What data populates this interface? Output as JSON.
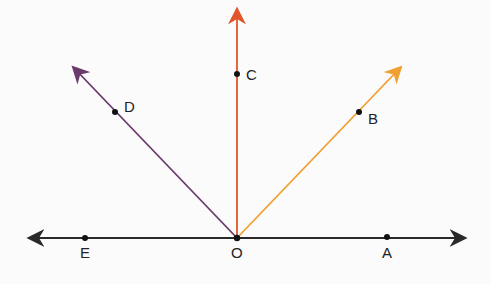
{
  "diagram": {
    "type": "rays from a point on a line",
    "origin": {
      "label": "O"
    },
    "points": [
      {
        "label": "A",
        "on": "line, right"
      },
      {
        "label": "B",
        "on": "ray OB"
      },
      {
        "label": "C",
        "on": "ray OC (vertical)"
      },
      {
        "label": "D",
        "on": "ray OD"
      },
      {
        "label": "E",
        "on": "line, left"
      }
    ],
    "colors": {
      "line": "#2a2a2a",
      "ray_c": "#e0552a",
      "ray_b": "#f0a030",
      "ray_d": "#6a3a6a",
      "point": "#111111"
    }
  }
}
